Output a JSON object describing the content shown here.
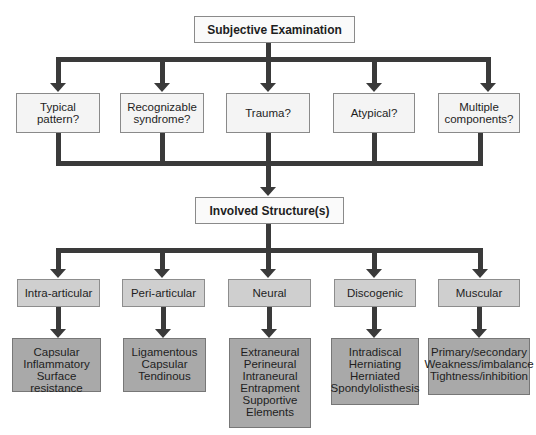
{
  "diagram": {
    "root": {
      "label": "Subjective Examination"
    },
    "questions": [
      {
        "line1": "Typical",
        "line2": "pattern?"
      },
      {
        "line1": "Recognizable",
        "line2": "syndrome?"
      },
      {
        "line1": "Trauma?",
        "line2": ""
      },
      {
        "line1": "Atypical?",
        "line2": ""
      },
      {
        "line1": "Multiple",
        "line2": "components?"
      }
    ],
    "middle": {
      "label": "Involved Structure(s)"
    },
    "categories": [
      {
        "label": "Intra-articular",
        "items": [
          "Capsular",
          "Inflammatory",
          "Surface resistance"
        ]
      },
      {
        "label": "Peri-articular",
        "items": [
          "Ligamentous",
          "Capsular",
          "Tendinous"
        ]
      },
      {
        "label": "Neural",
        "items": [
          "Extraneural",
          "Perineural",
          "Intraneural",
          "Entrapment",
          "Supportive",
          "Elements"
        ]
      },
      {
        "label": "Discogenic",
        "items": [
          "Intradiscal",
          "Herniating",
          "Herniated",
          "Spondylolisthesis"
        ]
      },
      {
        "label": "Muscular",
        "items": [
          "Primary/secondary",
          "Weakness/imbalance",
          "Tightness/inhibition"
        ]
      }
    ],
    "colors": {
      "line": "#3a3a3a",
      "white_box": "#f4f4f4",
      "category_box": "#cfcfcf",
      "detail_box": "#a9a9a9"
    }
  }
}
